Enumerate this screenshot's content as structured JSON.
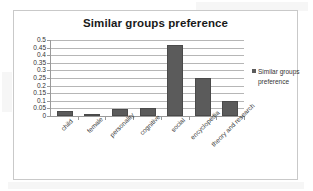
{
  "chart_data": {
    "type": "bar",
    "title": "Similar groups preference",
    "xlabel": "",
    "ylabel": "",
    "ylim": [
      0,
      0.5
    ],
    "grid": true,
    "legend_position": "right",
    "categories": [
      "child",
      "female",
      "personality",
      "cognitive",
      "social",
      "encyclopedia",
      "theory and research"
    ],
    "values": [
      0.03,
      0.01,
      0.045,
      0.05,
      0.47,
      0.25,
      0.1
    ],
    "series": [
      {
        "name": "Similar groups preference",
        "values": [
          0.03,
          0.01,
          0.045,
          0.05,
          0.47,
          0.25,
          0.1
        ]
      }
    ],
    "y_ticks": [
      "0.5",
      "0.45",
      "0.4",
      "0.35",
      "0.3",
      "0.25",
      "0.2",
      "0.15",
      "0.1",
      "0.05",
      "0"
    ],
    "y_tick_values": [
      0.5,
      0.45,
      0.4,
      0.35,
      0.3,
      0.25,
      0.2,
      0.15,
      0.1,
      0.05,
      0
    ]
  },
  "legend": {
    "entries": [
      {
        "label": "Similar groups preference",
        "color": "#5b5b5b"
      }
    ]
  },
  "colors": {
    "bar_fill": "#5b5b5b",
    "bar_border": "#4a4a4a",
    "grid": "#b6b6b6",
    "axis": "#9a9a9a",
    "frame": "#c9c9c9",
    "title_text": "#1a1a1a",
    "tick_text": "#333333"
  }
}
